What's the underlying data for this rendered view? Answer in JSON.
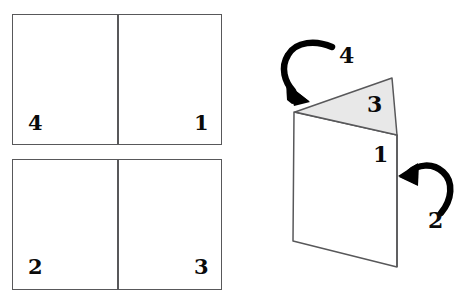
{
  "diagram": {
    "flat_sheets": [
      {
        "name": "top-sheet",
        "left_panel_label": "4",
        "right_panel_label": "1"
      },
      {
        "name": "bottom-sheet",
        "left_panel_label": "2",
        "right_panel_label": "3"
      }
    ],
    "folded_card": {
      "triangle_flap_label": "3",
      "front_panel_label": "1",
      "arrows": [
        {
          "name": "arrow-4",
          "label": "4",
          "direction": "down-left-onto-fold"
        },
        {
          "name": "arrow-2",
          "label": "2",
          "direction": "left-onto-right-edge"
        }
      ]
    },
    "colors": {
      "stroke": "#58585a",
      "flap_fill": "#e8e8e8",
      "panel_fill": "#ffffff",
      "ink": "#0a0a0a"
    }
  }
}
